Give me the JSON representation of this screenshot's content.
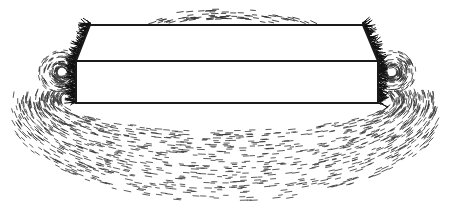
{
  "diagram": {
    "colors": {
      "background": "#ffffff",
      "ink": "#1a1a1a",
      "filings": "#333333"
    },
    "magnet": {
      "top_face": [
        [
          90,
          25
        ],
        [
          363,
          25
        ],
        [
          378,
          61
        ],
        [
          76,
          61
        ]
      ],
      "front_face": [
        [
          76,
          61
        ],
        [
          378,
          61
        ],
        [
          378,
          103
        ],
        [
          76,
          103
        ]
      ]
    },
    "field_regions": [
      {
        "name": "top-arc",
        "cx": 226,
        "cy": 40,
        "rx": 70,
        "ry": 18
      },
      {
        "name": "left-pole-small-loop",
        "cx": 62,
        "cy": 70,
        "rx": 20,
        "ry": 18
      },
      {
        "name": "right-pole-small-loop",
        "cx": 392,
        "cy": 70,
        "rx": 20,
        "ry": 18
      },
      {
        "name": "outer-loop-1",
        "cx": 226,
        "cy": 120,
        "rx": 195,
        "ry": 45
      },
      {
        "name": "outer-loop-2",
        "cx": 226,
        "cy": 130,
        "rx": 190,
        "ry": 55
      },
      {
        "name": "outer-loop-3",
        "cx": 226,
        "cy": 140,
        "rx": 185,
        "ry": 60
      }
    ]
  }
}
